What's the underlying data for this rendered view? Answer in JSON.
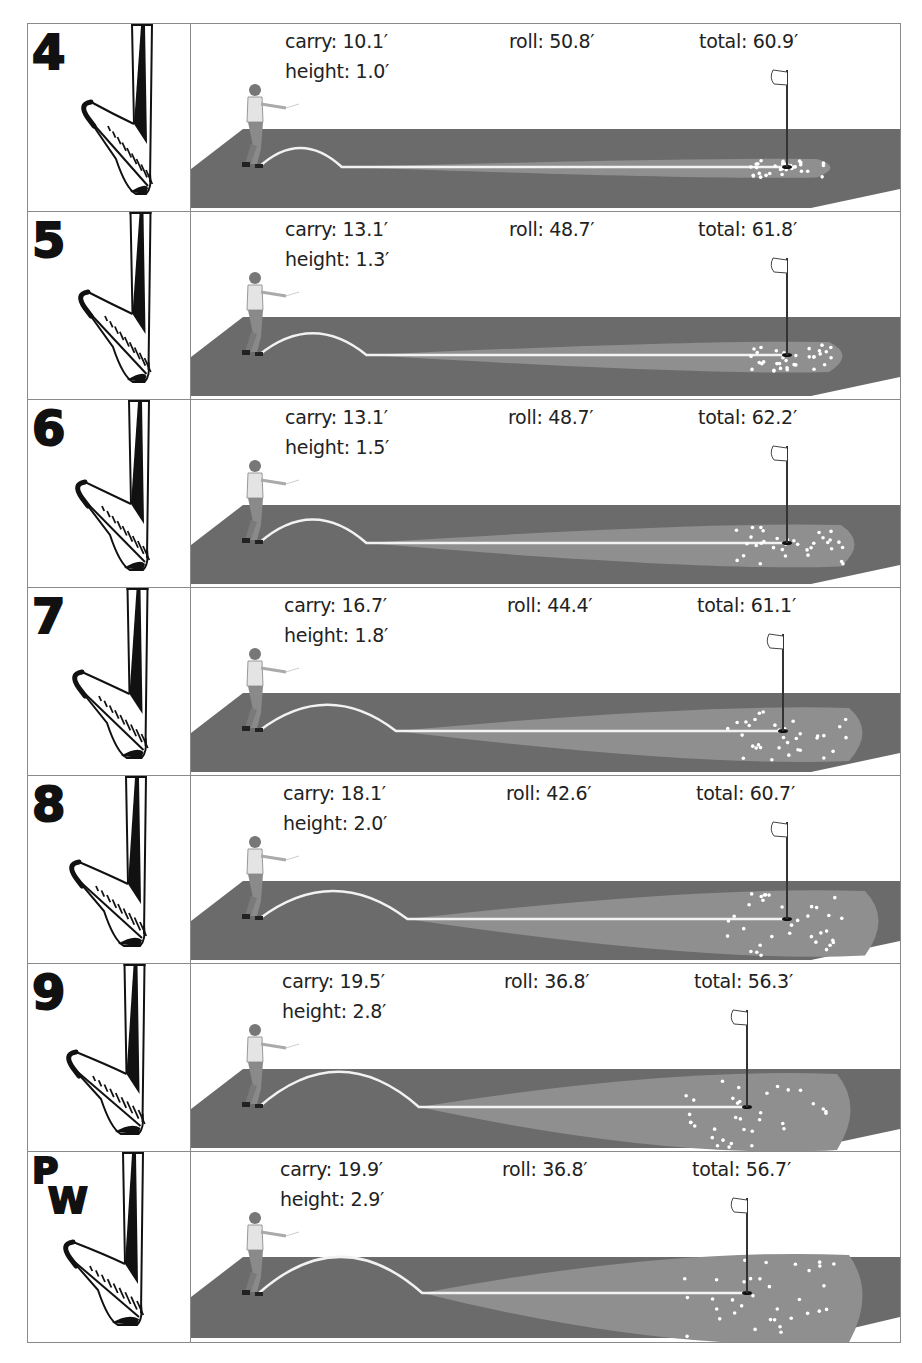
{
  "colors": {
    "frame": "#8a8a8a",
    "platform": "#6b6b6b",
    "green": "#8f8f8f",
    "ball_path": "#f2f2f2",
    "flag_pole": "#333333",
    "text": "#222222",
    "club_ink": "#111111"
  },
  "rows": [
    {
      "club": "4",
      "carry": "carry: 10.1′",
      "roll": "roll: 50.8′",
      "total": "total: 60.9′",
      "height": "height: 1.0′"
    },
    {
      "club": "5",
      "carry": "carry: 13.1′",
      "roll": "roll: 48.7′",
      "total": "total: 61.8′",
      "height": "height: 1.3′"
    },
    {
      "club": "6",
      "carry": "carry: 13.1′",
      "roll": "roll: 48.7′",
      "total": "total: 62.2′",
      "height": "height: 1.5′"
    },
    {
      "club": "7",
      "carry": "carry: 16.7′",
      "roll": "roll: 44.4′",
      "total": "total: 61.1′",
      "height": "height: 1.8′"
    },
    {
      "club": "8",
      "carry": "carry: 18.1′",
      "roll": "roll: 42.6′",
      "total": "total: 60.7′",
      "height": "height: 2.0′"
    },
    {
      "club": "9",
      "carry": "carry: 19.5′",
      "roll": "roll: 36.8′",
      "total": "total: 56.3′",
      "height": "height: 2.8′"
    },
    {
      "club": "PW",
      "club_p": "P",
      "club_w": "W",
      "carry": "carry: 19.9′",
      "roll": "roll: 36.8′",
      "total": "total: 56.7′",
      "height": "height: 2.9′"
    }
  ],
  "chart_data": {
    "type": "table",
    "title": "",
    "columns": [
      "club",
      "carry_ft",
      "height_ft",
      "roll_ft",
      "total_ft"
    ],
    "rows": [
      [
        "4",
        10.1,
        1.0,
        50.8,
        60.9
      ],
      [
        "5",
        13.1,
        1.3,
        48.7,
        61.8
      ],
      [
        "6",
        13.1,
        1.5,
        48.7,
        62.2
      ],
      [
        "7",
        16.7,
        1.8,
        44.4,
        61.1
      ],
      [
        "8",
        18.1,
        2.0,
        42.6,
        60.7
      ],
      [
        "9",
        19.5,
        2.8,
        36.8,
        56.3
      ],
      [
        "PW",
        19.9,
        2.9,
        36.8,
        56.7
      ]
    ],
    "units": "feet"
  }
}
